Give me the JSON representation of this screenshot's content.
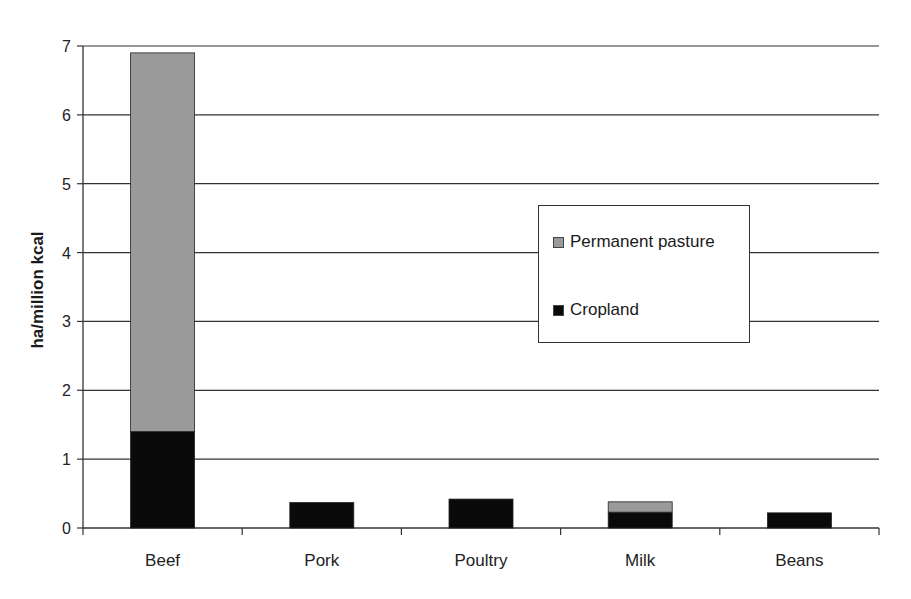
{
  "chart_data": {
    "type": "bar",
    "stacked": true,
    "title": "",
    "xlabel": "",
    "ylabel": "ha/million kcal",
    "ylim": [
      0,
      7
    ],
    "yticks": [
      0,
      1,
      2,
      3,
      4,
      5,
      6,
      7
    ],
    "grid": true,
    "legend_position": "inside-right",
    "categories": [
      "Beef",
      "Pork",
      "Poultry",
      "Milk",
      "Beans"
    ],
    "series": [
      {
        "name": "Cropland",
        "color": "#0a0a0a",
        "values": [
          1.4,
          0.37,
          0.42,
          0.23,
          0.22
        ]
      },
      {
        "name": "Permanent pasture",
        "color": "#9a9a9a",
        "values": [
          5.5,
          0,
          0,
          0.15,
          0
        ]
      }
    ]
  },
  "legend": {
    "items": [
      {
        "label": "Permanent pasture",
        "color": "#9a9a9a"
      },
      {
        "label": "Cropland",
        "color": "#0a0a0a"
      }
    ]
  }
}
